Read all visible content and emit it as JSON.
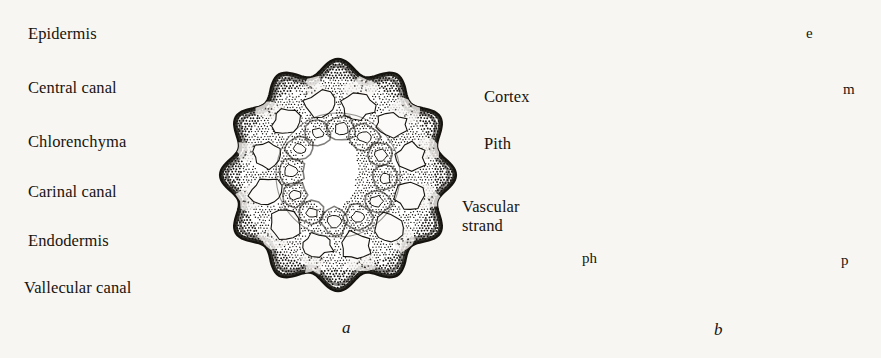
{
  "figure": {
    "background_color": "#f8f6f3",
    "ink_color": "#17140f",
    "panels": [
      {
        "caption": "a",
        "description": "transverse section of Equisetum stem showing lobed cortex, canals and vascular strands"
      },
      {
        "caption": "b",
        "description": "detail of vascular strand and surrounding cells"
      }
    ]
  },
  "panel_a": {
    "caption": "a",
    "labels_left": [
      {
        "id": "epidermis",
        "text": "Epidermis",
        "x": 28,
        "y": 38
      },
      {
        "id": "central-canal",
        "text": "Central canal",
        "x": 28,
        "y": 92
      },
      {
        "id": "chlorenchyma",
        "text": "Chlorenchyma",
        "x": 28,
        "y": 146
      },
      {
        "id": "carinal-canal",
        "text": "Carinal canal",
        "x": 28,
        "y": 196
      },
      {
        "id": "endodermis",
        "text": "Endodermis",
        "x": 28,
        "y": 245
      },
      {
        "id": "vallecular-canal",
        "text": "Vallecular canal",
        "x": 24,
        "y": 292
      }
    ],
    "labels_right": [
      {
        "id": "cortex",
        "text": "Cortex",
        "x": 484,
        "y": 101
      },
      {
        "id": "pith",
        "text": "Pith",
        "x": 484,
        "y": 148
      },
      {
        "id": "vascular-strand",
        "text": "Vascular\nstrand",
        "x": 462,
        "y": 211
      }
    ]
  },
  "panel_b": {
    "caption": "b",
    "labels": [
      {
        "id": "epidermis-abbr",
        "text": "e",
        "x": 806,
        "y": 39
      },
      {
        "id": "metaxylem-abbr",
        "text": "m",
        "x": 843,
        "y": 95
      },
      {
        "id": "phloem-abbr",
        "text": "ph",
        "x": 582,
        "y": 264
      },
      {
        "id": "protoxylem-abbr",
        "text": "p",
        "x": 841,
        "y": 266
      }
    ]
  }
}
